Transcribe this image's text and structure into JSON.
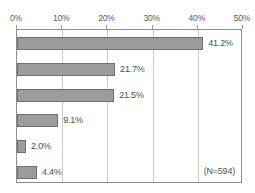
{
  "chart_data": {
    "type": "bar",
    "orientation": "horizontal",
    "title": "",
    "subtitle": "",
    "xlabel": "",
    "ylabel": "",
    "xlim": [
      0,
      50
    ],
    "grid": true,
    "legend": null,
    "categories": [
      "",
      "",
      "",
      "",
      "",
      ""
    ],
    "values": [
      41.2,
      21.7,
      21.5,
      9.1,
      2.0,
      4.4
    ],
    "data_labels": [
      "41.2%",
      "21.7%",
      "21.5%",
      "9.1%",
      "2.0%",
      "4.4%"
    ],
    "tick_values": [
      0,
      10,
      20,
      30,
      40,
      50
    ],
    "tick_labels": [
      "0%",
      "10%",
      "20%",
      "30%",
      "40%",
      "50%"
    ],
    "annotations": [
      {
        "text": "(N=594)",
        "position": "bottom-right"
      }
    ],
    "colors": {
      "bar_fill": "#9c9c9c",
      "bar_border": "#6f6f6f",
      "gridline": "#c9c9c9",
      "frame": "#8d8d8d",
      "text": "#4f4f4f",
      "background": "#ffffff"
    }
  }
}
